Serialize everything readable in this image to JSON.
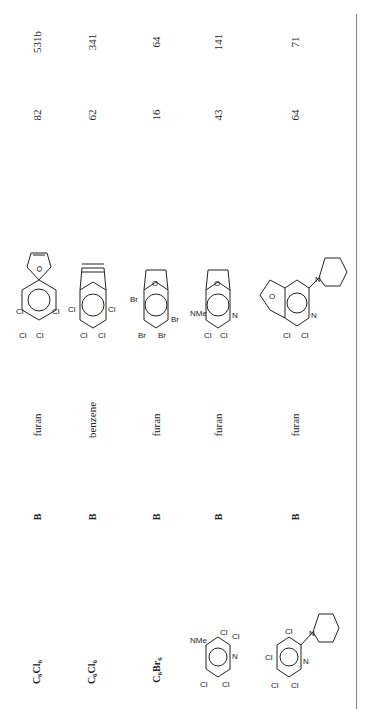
{
  "table": {
    "orientation": "rotated-90-ccw",
    "rows": [
      {
        "substrate": {
          "formula_base": "C",
          "sub1": "6",
          "elem": "Cl",
          "sub2": "6"
        },
        "method": "B",
        "trap": "furan",
        "adduct": "tetrachloro-epoxynaphthalene (furan adduct)",
        "yield": "82",
        "ref": "531b"
      },
      {
        "substrate": {
          "formula_base": "C",
          "sub1": "6",
          "elem": "Cl",
          "sub2": "6"
        },
        "method": "B",
        "trap": "benzene",
        "adduct": "tetrachloro-ethenonaphthalene (benzene adduct)",
        "yield": "62",
        "ref": "341"
      },
      {
        "substrate": {
          "formula_base": "C",
          "sub1": "6",
          "elem": "Br",
          "sub2": "6"
        },
        "method": "B",
        "trap": "furan",
        "adduct": "tetrabromo-epoxynaphthalene (furan adduct)",
        "yield": "16",
        "ref": "64"
      },
      {
        "substrate": {
          "structure": "4-dimethylamino-2,3,5,6-tetrachloropyridine",
          "labels": [
            "NMe2",
            "Cl",
            "Cl",
            "Cl",
            "Cl",
            "N"
          ]
        },
        "method": "B",
        "trap": "furan",
        "adduct": "NMe2 dichloro epoxy-quinoline adduct",
        "yield": "43",
        "ref": "141"
      },
      {
        "substrate": {
          "structure": "2-piperidino-3,4,5,6-tetrachloropyridine",
          "labels": [
            "Cl",
            "Cl",
            "Cl",
            "Cl",
            "N",
            "N"
          ]
        },
        "method": "B",
        "trap": "furan",
        "adduct": "piperidino dichloro epoxy-isoquinoline adduct",
        "yield": "64",
        "ref": "71"
      }
    ],
    "mol_labels": {
      "cl": "Cl",
      "br": "Br",
      "o": "O",
      "n": "N",
      "nme2": "NMe",
      "two": "2"
    }
  }
}
